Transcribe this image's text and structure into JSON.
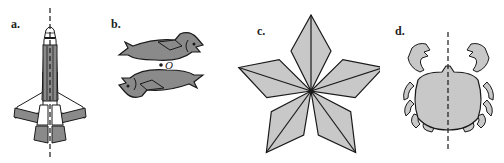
{
  "figure": {
    "panels": [
      {
        "id": "a",
        "label": "a.",
        "subject": "space shuttle",
        "symmetry": "line symmetry",
        "axis": "vertical dashed line"
      },
      {
        "id": "b",
        "label": "b.",
        "subject": "two fish",
        "symmetry": "point symmetry",
        "center_label": "O"
      },
      {
        "id": "c",
        "label": "c.",
        "subject": "five-pointed star of rhombi",
        "symmetry": "rotational symmetry",
        "order": 5
      },
      {
        "id": "d",
        "label": "d.",
        "subject": "crab",
        "symmetry": "line symmetry",
        "axis": "vertical dashed line"
      }
    ]
  },
  "colors": {
    "dark_fill": "#8a8a8a",
    "light_fill": "#c8c8c8",
    "stroke": "#1a1a1a",
    "background": "#ffffff"
  }
}
